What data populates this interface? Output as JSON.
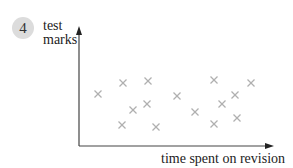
{
  "badge": {
    "number": "4"
  },
  "chart_data": {
    "type": "scatter",
    "title": "",
    "xlabel": "time spent on revision",
    "ylabel": "test marks",
    "ylabel_lines": [
      "test",
      "marks"
    ],
    "axes_ticks": false,
    "grid": false,
    "legend": null,
    "marker": "x",
    "marker_color": "#b0b0b0",
    "axis_color": "#444444",
    "points_px": [
      {
        "x": 98,
        "y": 94
      },
      {
        "x": 123,
        "y": 83
      },
      {
        "x": 148,
        "y": 81
      },
      {
        "x": 133,
        "y": 110
      },
      {
        "x": 147,
        "y": 104
      },
      {
        "x": 122,
        "y": 125
      },
      {
        "x": 156,
        "y": 127
      },
      {
        "x": 177,
        "y": 96
      },
      {
        "x": 214,
        "y": 80
      },
      {
        "x": 251,
        "y": 83
      },
      {
        "x": 235,
        "y": 95
      },
      {
        "x": 222,
        "y": 104
      },
      {
        "x": 195,
        "y": 112
      },
      {
        "x": 237,
        "y": 118
      },
      {
        "x": 214,
        "y": 124
      }
    ],
    "note": "No numeric scale shown; points given in pixel coordinates (origin top-left). Pattern shows no correlation."
  }
}
